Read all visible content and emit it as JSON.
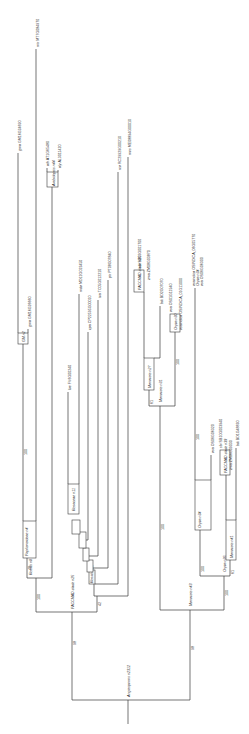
{
  "figure": {
    "type": "phylogenetic-tree",
    "orientation": "rotated-90-ccw",
    "root": {
      "label": "Angiosperms n2312"
    },
    "clades": {
      "eudicots": {
        "label": "Rosids n22",
        "support": "98"
      },
      "monocots": {
        "label": "Monocots n43",
        "support": "98"
      }
    },
    "leaves": [
      {
        "id": "mtr",
        "species": "mtr",
        "gene": "MT7G084970"
      },
      {
        "id": "gma1",
        "species": "gma",
        "gene": "GM16G24690"
      },
      {
        "id": "gma2",
        "species": "gma",
        "gene": "GM16G26660"
      },
      {
        "id": "ath",
        "species": "ath",
        "gene": "AT1G65480"
      },
      {
        "id": "aly",
        "species": "aly",
        "gene": "AL3011420"
      },
      {
        "id": "fve",
        "species": "fve",
        "gene": "FV6G00240"
      },
      {
        "id": "mdo",
        "species": "mdo",
        "gene": "MD12G023450"
      },
      {
        "id": "rco",
        "species": "rco",
        "gene": "RC29929G00210"
      },
      {
        "id": "cpa",
        "species": "cpa",
        "gene": "CP22595G00010"
      },
      {
        "id": "tca",
        "species": "tca",
        "gene": "TC05G012210"
      },
      {
        "id": "ptr",
        "species": "ptr",
        "gene": "PT08G07840"
      },
      {
        "id": "mes",
        "species": "mes",
        "gene": "ME08894G00010"
      },
      {
        "id": "sbi1",
        "species": "sbi",
        "gene": "SB03G001700"
      },
      {
        "id": "zma1",
        "species": "zma",
        "gene": "ZM08G03870"
      },
      {
        "id": "bdi1",
        "species": "bdi",
        "gene": "BD2G07070"
      },
      {
        "id": "osa1",
        "species": "osa",
        "gene": "OS01G11940"
      },
      {
        "id": "osi1",
        "species": "osaindica",
        "gene": "OSINDICA_01G11000"
      },
      {
        "id": "osi2",
        "species": "osaindica",
        "gene": "OSINDICA_06G05770"
      },
      {
        "id": "osa2",
        "species": "osa",
        "gene": "OS06G06300"
      },
      {
        "id": "osa3",
        "species": "osa",
        "gene": "OS06G06320"
      },
      {
        "id": "sbi2",
        "species": "sbi",
        "gene": "SB10G003940"
      },
      {
        "id": "zma2",
        "species": "zma",
        "gene": "ZM06G09030"
      },
      {
        "id": "bdi2",
        "species": "bdi",
        "gene": "BD1G48830"
      }
    ],
    "internal_nodes": [
      {
        "label": "Rosids n8",
        "support": "100"
      },
      {
        "label": "Papilionoideae n4",
        "support": "48"
      },
      {
        "label": "GM n2",
        "support": "100"
      },
      {
        "label": "Arabidopsis n44",
        "support": ""
      },
      {
        "label": "Rosaceae n11",
        "support": ""
      },
      {
        "label": "Rosids n13",
        "support": "46"
      },
      {
        "label": "Rosids n15",
        "support": "48"
      },
      {
        "label": "Rosids n17",
        "support": "58"
      },
      {
        "label": "Rosids n19",
        "support": "56"
      },
      {
        "label": "Rosids n21",
        "support": "47"
      },
      {
        "label": "Rosids n22",
        "support": "42"
      },
      {
        "label": "PACCMAD clade n25",
        "support": ""
      },
      {
        "label": "Monocots n27",
        "support": "100"
      },
      {
        "label": "Monocots n31",
        "support": "61"
      },
      {
        "label": "Oryza n30",
        "support": ""
      },
      {
        "label": "Oryza n34",
        "support": ""
      },
      {
        "label": "Oryza n36",
        "support": "100"
      },
      {
        "label": "Monocots n42",
        "support": "56"
      },
      {
        "label": "PACCMAD clade n39",
        "support": ""
      },
      {
        "label": "Monocots n41",
        "support": "100"
      },
      {
        "label": "Monocots n43",
        "support": "100"
      }
    ],
    "extra_supports": {
      "monocot_n31_stem": "100",
      "oryza_stem": "100",
      "monocot_n42_stem": "100",
      "n42_sub": "61"
    }
  }
}
